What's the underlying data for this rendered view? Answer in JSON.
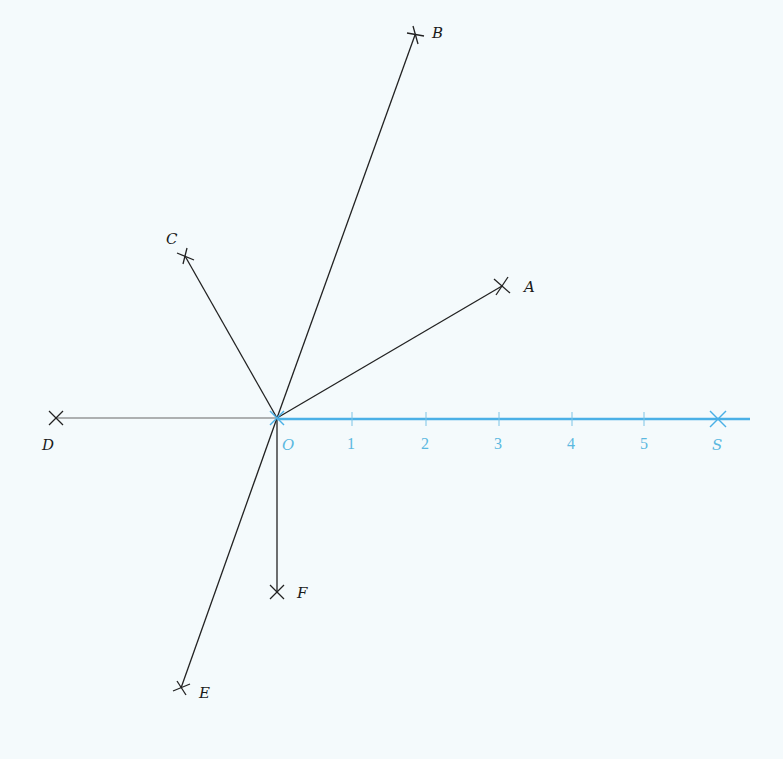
{
  "figure": {
    "origin_label": "O",
    "scale_end_label": "S",
    "scale_ticks": [
      "1",
      "2",
      "3",
      "4",
      "5"
    ],
    "points": [
      {
        "name": "A",
        "label": "A"
      },
      {
        "name": "B",
        "label": "B"
      },
      {
        "name": "C",
        "label": "C"
      },
      {
        "name": "D",
        "label": "D"
      },
      {
        "name": "E",
        "label": "E"
      },
      {
        "name": "F",
        "label": "F"
      }
    ],
    "colors": {
      "background": "#f4fafc",
      "rays": "#222222",
      "scale_axis": "#4ab0e6",
      "scale_text": "#5bb8e0"
    }
  }
}
